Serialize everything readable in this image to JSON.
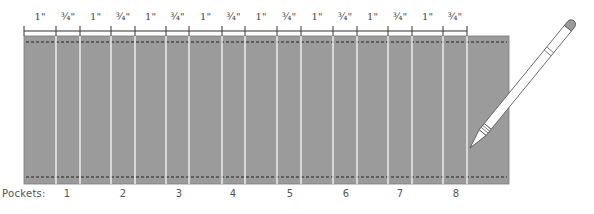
{
  "diagram": {
    "panel_color": "#9b9b9b",
    "panel_border": "#7a7a7a",
    "fold_line_color": "#f2f2f2",
    "dash_color": "#222222",
    "ruler_color": "#333333",
    "segments": [
      {
        "label": "1\"",
        "width_in": 1
      },
      {
        "label": "¾\"",
        "width_in": 0.75
      },
      {
        "label": "1\"",
        "width_in": 1
      },
      {
        "label": "¾\"",
        "width_in": 0.75
      },
      {
        "label": "1\"",
        "width_in": 1
      },
      {
        "label": "¾\"",
        "width_in": 0.75
      },
      {
        "label": "1\"",
        "width_in": 1
      },
      {
        "label": "¾\"",
        "width_in": 0.75
      },
      {
        "label": "1\"",
        "width_in": 1
      },
      {
        "label": "¾\"",
        "width_in": 0.75
      },
      {
        "label": "1\"",
        "width_in": 1
      },
      {
        "label": "¾\"",
        "width_in": 0.75
      },
      {
        "label": "1\"",
        "width_in": 1
      },
      {
        "label": "¾\"",
        "width_in": 0.75
      },
      {
        "label": "1\"",
        "width_in": 1
      },
      {
        "label": "¾\"",
        "width_in": 0.75
      }
    ],
    "tick_x": [
      24,
      56,
      80,
      111,
      135,
      166,
      189,
      222,
      245,
      277,
      301,
      333,
      357,
      388,
      412,
      443,
      467
    ],
    "pockets": {
      "title": "Pockets:",
      "labels": [
        "1",
        "2",
        "3",
        "4",
        "5",
        "6",
        "7",
        "8"
      ],
      "x": [
        67,
        123,
        179,
        233,
        290,
        346,
        400,
        456
      ]
    },
    "pencil": {
      "tip": [
        470,
        148
      ],
      "end": [
        573,
        22
      ]
    }
  }
}
